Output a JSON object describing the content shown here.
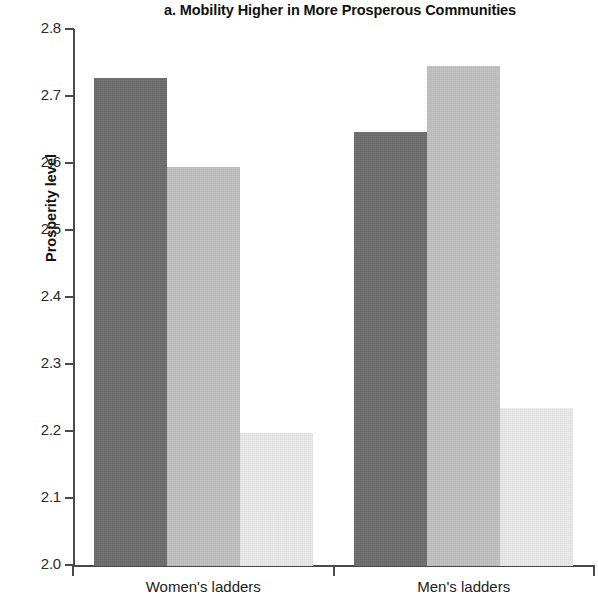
{
  "chart_data": {
    "type": "bar",
    "title": "a. Mobility Higher in More Prosperous Communities",
    "xlabel": "",
    "ylabel": "Prosperity level",
    "ylim": [
      2.0,
      2.8
    ],
    "ytick_labels": [
      "2.8",
      "2.7",
      "2.6",
      "2.5",
      "2.4",
      "2.3",
      "2.2",
      "2.1",
      "2.0"
    ],
    "ytick_values": [
      2.8,
      2.7,
      2.6,
      2.5,
      2.4,
      2.3,
      2.2,
      2.1,
      2.0
    ],
    "categories": [
      "Women's ladders",
      "Men's ladders"
    ],
    "grid": false,
    "legend": "none",
    "series": [
      {
        "name": "series-1",
        "shade": "dark",
        "color": "#6d6d6d",
        "values": [
          2.728,
          2.648
        ]
      },
      {
        "name": "series-2",
        "shade": "mid",
        "color": "#c2c2c2",
        "values": [
          2.596,
          2.747
        ]
      },
      {
        "name": "series-3",
        "shade": "light",
        "color": "#eaeaea",
        "values": [
          2.198,
          2.236
        ]
      }
    ],
    "bars": [
      {
        "group": "Women's ladders",
        "series": "series-1",
        "value": 2.728,
        "shade": "dark"
      },
      {
        "group": "Women's ladders",
        "series": "series-2",
        "value": 2.596,
        "shade": "mid"
      },
      {
        "group": "Women's ladders",
        "series": "series-3",
        "value": 2.198,
        "shade": "light"
      },
      {
        "group": "Men's ladders",
        "series": "series-1",
        "value": 2.648,
        "shade": "dark"
      },
      {
        "group": "Men's ladders",
        "series": "series-2",
        "value": 2.747,
        "shade": "mid"
      },
      {
        "group": "Men's ladders",
        "series": "series-3",
        "value": 2.236,
        "shade": "light"
      }
    ]
  }
}
